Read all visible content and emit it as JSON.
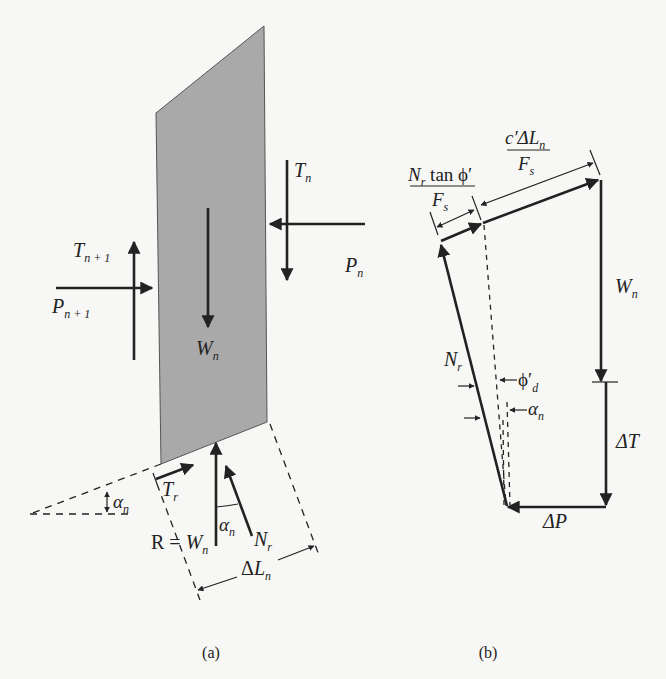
{
  "figure_a": {
    "caption": "(a)",
    "slice": {
      "fill": "#a9a9a9"
    },
    "labels": {
      "T_n": {
        "main": "T",
        "sub": "n"
      },
      "P_n": {
        "main": "P",
        "sub": "n"
      },
      "T_n1": {
        "main": "T",
        "sub": "n + 1"
      },
      "P_n1": {
        "main": "P",
        "sub": "n + 1"
      },
      "W_n": {
        "main": "W",
        "sub": "n"
      },
      "T_r": {
        "main": "T",
        "sub": "r"
      },
      "alpha_base": {
        "main": "α",
        "sub": "n"
      },
      "alpha_inner": {
        "main": "α",
        "sub": "n"
      },
      "R_eq": {
        "prefix": "R = ",
        "main": "W",
        "sub": "n"
      },
      "N_r": {
        "main": "N",
        "sub": "r"
      },
      "delta_L": {
        "prefix": "Δ",
        "main": "L",
        "sub": "n"
      }
    }
  },
  "figure_b": {
    "caption": "(b)",
    "labels": {
      "friction_num": {
        "main": "N",
        "sub": "r",
        "rest": " tan ϕ′"
      },
      "friction_den": {
        "main": "F",
        "sub": "s"
      },
      "cohesion_num": {
        "main": "c′ΔL",
        "sub": "n"
      },
      "cohesion_den": {
        "main": "F",
        "sub": "s"
      },
      "W_n": {
        "main": "W",
        "sub": "n"
      },
      "N_r": {
        "main": "N",
        "sub": "r"
      },
      "phi_d": {
        "main": "ϕ′",
        "sub": "d"
      },
      "alpha_n": {
        "main": "α",
        "sub": "n"
      },
      "delta_T": {
        "main": "ΔT"
      },
      "delta_P": {
        "main": "ΔP"
      }
    }
  }
}
